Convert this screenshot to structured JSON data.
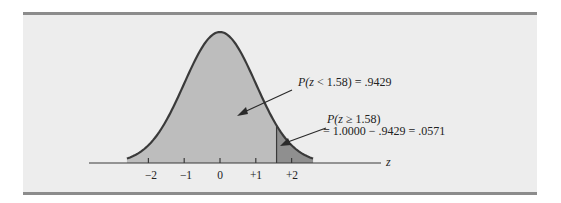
{
  "chart_data": {
    "type": "area",
    "title": "",
    "xlabel": "z",
    "ylabel": "",
    "x_ticks": [
      -2,
      -1,
      0,
      1,
      2
    ],
    "x_tick_labels": [
      "−2",
      "−1",
      "0",
      "+1",
      "+2"
    ],
    "xlim": [
      -2.6,
      2.6
    ],
    "grid": false,
    "boundary_z": 1.58,
    "regions": [
      {
        "name": "left area",
        "range": [
          -2.6,
          1.58
        ],
        "probability": 0.9429,
        "color": "#bdbdbd"
      },
      {
        "name": "right tail",
        "range": [
          1.58,
          2.6
        ],
        "probability": 0.0571,
        "color": "#8f8f8f"
      }
    ],
    "annotations": [
      {
        "id": "left",
        "text_prefix": "P(",
        "var": "z",
        "text_suffix": " < 1.58)  = .9429"
      },
      {
        "id": "right_line1_prefix",
        "text_prefix": "P(",
        "var": "z",
        "text_suffix": " ≥ 1.58)"
      },
      {
        "id": "right_line2",
        "text": "= 1.0000 − .9429 = .0571"
      }
    ]
  },
  "labels": {
    "axis_var": "z",
    "tick_m2": "−2",
    "tick_m1": "−1",
    "tick_0": "0",
    "tick_p1": "+1",
    "tick_p2": "+2",
    "ann_left_p": "P(",
    "ann_left_z": "z",
    "ann_left_rest": " < 1.58)  = .9429",
    "ann_right_p": "P(",
    "ann_right_z": "z",
    "ann_right_rest": " ≥ 1.58)",
    "ann_right_line2": "= 1.0000 − .9429 = .0571"
  },
  "colors": {
    "panel_bg": "#ededed",
    "rule": "#8c8c8c",
    "left_fill": "#bdbdbd",
    "tail_fill": "#8f8f8f",
    "curve": "#3a3a3a"
  }
}
